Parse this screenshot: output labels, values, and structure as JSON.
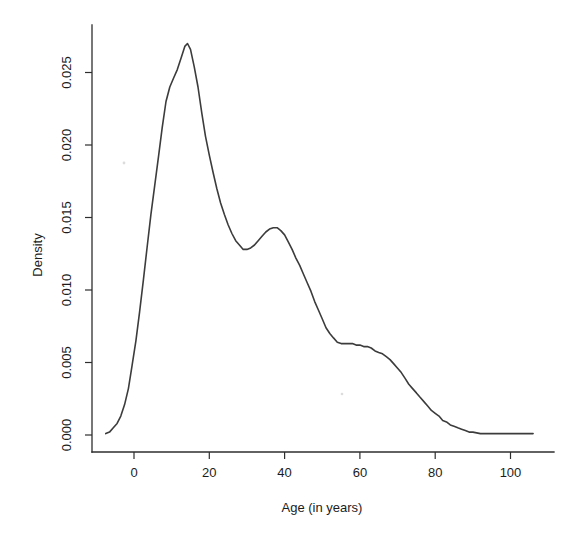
{
  "colors": {
    "background": "#ffffff",
    "ink": "#1c1c1c",
    "axis": "#2e2e2e",
    "curve": "#3c3c3c"
  },
  "chart_data": {
    "type": "line",
    "title": "",
    "xlabel": "Age (in years)",
    "ylabel": "Density",
    "xlim": [
      -11,
      112
    ],
    "ylim": [
      0,
      0.0283
    ],
    "grid": false,
    "legend": "none",
    "x_ticks": [
      0,
      20,
      40,
      60,
      80,
      100
    ],
    "x_tick_labels": [
      "0",
      "20",
      "40",
      "60",
      "80",
      "100"
    ],
    "y_ticks": [
      0.0,
      0.005,
      0.01,
      0.015,
      0.02,
      0.025
    ],
    "y_tick_labels": [
      "0.000",
      "0.005",
      "0.010",
      "0.015",
      "0.020",
      "0.025"
    ],
    "series": [
      {
        "name": "age-density-estimate",
        "x": [
          -7.5,
          -6.5,
          -5.5,
          -4.5,
          -3.5,
          -2.5,
          -1.5,
          -0.5,
          0.5,
          1.5,
          2.5,
          3.5,
          4.5,
          5.5,
          6.5,
          7.5,
          8.5,
          9.5,
          10.5,
          11.5,
          12.5,
          13.5,
          14.2,
          15,
          16,
          17,
          18,
          19,
          20,
          21,
          22,
          23,
          24,
          25,
          26,
          27,
          28,
          29,
          30,
          31,
          32,
          33,
          34,
          35,
          36,
          37,
          38,
          39,
          40,
          41,
          42,
          43,
          44,
          45,
          46,
          47,
          48,
          49,
          50,
          51,
          52,
          53,
          54,
          55,
          56,
          57,
          58,
          59,
          60,
          61,
          62,
          63,
          64,
          65,
          66,
          67,
          68,
          69,
          70,
          71,
          72,
          73,
          74,
          75,
          76,
          77,
          78,
          79,
          80,
          81,
          82,
          83,
          84,
          85,
          86,
          87,
          88,
          89,
          90,
          92,
          94,
          96,
          100,
          103,
          106
        ],
        "y": [
          0.0001,
          0.0002,
          0.0005,
          0.0008,
          0.0013,
          0.0021,
          0.0032,
          0.0048,
          0.0065,
          0.0085,
          0.0107,
          0.013,
          0.0152,
          0.0172,
          0.0192,
          0.0212,
          0.023,
          0.024,
          0.0246,
          0.0252,
          0.026,
          0.0268,
          0.027,
          0.0266,
          0.0254,
          0.024,
          0.0222,
          0.0206,
          0.0193,
          0.0181,
          0.017,
          0.016,
          0.0152,
          0.0145,
          0.0139,
          0.0134,
          0.0131,
          0.0128,
          0.0128,
          0.0129,
          0.0131,
          0.0134,
          0.0137,
          0.014,
          0.0142,
          0.0143,
          0.0143,
          0.0141,
          0.0138,
          0.0133,
          0.0128,
          0.0122,
          0.0117,
          0.0111,
          0.0105,
          0.0099,
          0.0092,
          0.0086,
          0.008,
          0.0074,
          0.007,
          0.0067,
          0.0064,
          0.0063,
          0.0063,
          0.0063,
          0.0063,
          0.0062,
          0.0062,
          0.0061,
          0.0061,
          0.006,
          0.0058,
          0.0057,
          0.0056,
          0.0054,
          0.0052,
          0.0049,
          0.0046,
          0.0043,
          0.0039,
          0.0035,
          0.0032,
          0.0029,
          0.0026,
          0.0023,
          0.002,
          0.0017,
          0.0015,
          0.0013,
          0.001,
          0.0009,
          0.0007,
          0.0006,
          0.0005,
          0.0004,
          0.0003,
          0.0002,
          0.0002,
          0.0001,
          0.0001,
          0.0001,
          0.0001,
          0.0001,
          0.0001
        ]
      }
    ]
  }
}
